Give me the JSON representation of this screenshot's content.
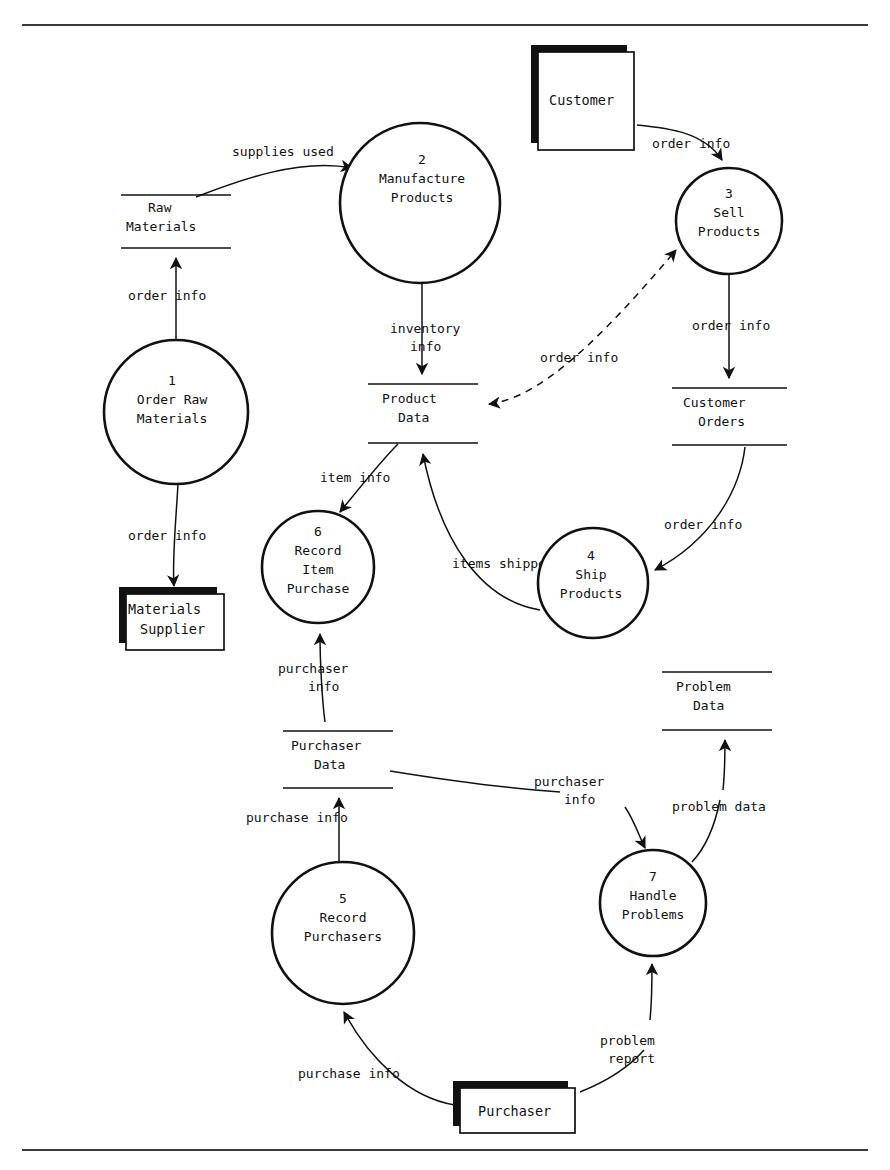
{
  "diagram": {
    "type": "data-flow-diagram",
    "title": "",
    "notation": "Yourdon/DeMarco",
    "processes": [
      {
        "id": "p1",
        "number": "1",
        "name_line1": "Order Raw",
        "name_line2": "Materials",
        "name_line3": "",
        "cx": 176,
        "cy": 412,
        "r": 72
      },
      {
        "id": "p2",
        "number": "2",
        "name_line1": "Manufacture",
        "name_line2": "Products",
        "name_line3": "",
        "cx": 420,
        "cy": 203,
        "r": 80
      },
      {
        "id": "p3",
        "number": "3",
        "name_line1": "Sell",
        "name_line2": "Products",
        "name_line3": "",
        "cx": 729,
        "cy": 221,
        "r": 53
      },
      {
        "id": "p4",
        "number": "4",
        "name_line1": "Ship",
        "name_line2": "Products",
        "name_line3": "",
        "cx": 593,
        "cy": 583,
        "r": 55
      },
      {
        "id": "p5",
        "number": "5",
        "name_line1": "Record",
        "name_line2": "Purchasers",
        "name_line3": "",
        "cx": 343,
        "cy": 933,
        "r": 71
      },
      {
        "id": "p6",
        "number": "6",
        "name_line1": "Record",
        "name_line2": "Item",
        "name_line3": "Purchase",
        "cx": 318,
        "cy": 567,
        "r": 56
      },
      {
        "id": "p7",
        "number": "7",
        "name_line1": "Handle",
        "name_line2": "Problems",
        "name_line3": "",
        "cx": 653,
        "cy": 903,
        "r": 53
      }
    ],
    "data_stores": [
      {
        "id": "ds-raw",
        "name_line1": "Raw",
        "name_line2": "Materials",
        "x1": 121,
        "x2": 231,
        "y_top": 195,
        "y_bottom": 248
      },
      {
        "id": "ds-product",
        "name_line1": "Product",
        "name_line2": "Data",
        "x1": 368,
        "x2": 478,
        "y_top": 384,
        "y_bottom": 443
      },
      {
        "id": "ds-customer-orders",
        "name_line1": "Customer",
        "name_line2": "Orders",
        "x1": 672,
        "x2": 787,
        "y_top": 388,
        "y_bottom": 445
      },
      {
        "id": "ds-purchaser",
        "name_line1": "Purchaser",
        "name_line2": "Data",
        "x1": 283,
        "x2": 393,
        "y_top": 731,
        "y_bottom": 788
      },
      {
        "id": "ds-problem",
        "name_line1": "Problem",
        "name_line2": "Data",
        "x1": 662,
        "x2": 772,
        "y_top": 672,
        "y_bottom": 730
      }
    ],
    "external_entities": [
      {
        "id": "ext-customer",
        "name": "Customer",
        "x": 538,
        "y": 52,
        "w": 96,
        "h": 98
      },
      {
        "id": "ext-materials-supplier",
        "name_line1": "Materials",
        "name_line2": "Supplier",
        "x": 126,
        "y": 594,
        "w": 98,
        "h": 56
      },
      {
        "id": "ext-purchaser",
        "name": "Purchaser",
        "x": 460,
        "y": 1088,
        "w": 115,
        "h": 45
      }
    ],
    "data_flows": [
      {
        "id": "f-supplies-used",
        "label": "supplies used",
        "from": "ds-raw",
        "to": "p2",
        "label_x": 232,
        "label_y": 156,
        "style": "solid"
      },
      {
        "id": "f-order-info-raw",
        "label": "order info",
        "from": "p1",
        "to": "ds-raw",
        "label_x": 128,
        "label_y": 300,
        "style": "solid"
      },
      {
        "id": "f-order-info-supplier",
        "label": "order info",
        "from": "p1",
        "to": "ext-materials-supplier",
        "label_x": 128,
        "label_y": 540,
        "style": "solid"
      },
      {
        "id": "f-order-info-customer",
        "label": "order info",
        "from": "ext-customer",
        "to": "p3",
        "label_x": 652,
        "label_y": 148,
        "style": "solid"
      },
      {
        "id": "f-inventory-info",
        "label": "inventory info",
        "label_line1": "inventory",
        "label_line2": "info",
        "from": "p2",
        "to": "ds-product",
        "label_x": 390,
        "label_y": 330,
        "style": "solid"
      },
      {
        "id": "f-order-info-product",
        "label": "order info",
        "from": "ds-product",
        "to": "p3",
        "label_x": 540,
        "label_y": 362,
        "style": "dashed"
      },
      {
        "id": "f-order-info-orders",
        "label": "order info",
        "from": "p3",
        "to": "ds-customer-orders",
        "label_x": 692,
        "label_y": 328,
        "style": "solid"
      },
      {
        "id": "f-order-info-ship",
        "label": "order info",
        "from": "ds-customer-orders",
        "to": "p4",
        "label_x": 664,
        "label_y": 528,
        "style": "solid"
      },
      {
        "id": "f-item-info",
        "label": "item info",
        "from": "p6",
        "to": "ds-product",
        "label_x": 320,
        "label_y": 480,
        "style": "solid"
      },
      {
        "id": "f-items-shipped",
        "label": "items shipped",
        "from": "p4",
        "to": "ds-product",
        "label_x": 452,
        "label_y": 566,
        "style": "solid"
      },
      {
        "id": "f-purchaser-info-store",
        "label": "purchaser info",
        "label_line1": "purchaser",
        "label_line2": "info",
        "from": "ds-purchaser",
        "to": "p6",
        "label_x": 280,
        "label_y": 673,
        "style": "solid"
      },
      {
        "id": "f-purchase-info-store",
        "label": "purchase info",
        "from": "p5",
        "to": "ds-purchaser",
        "label_x": 246,
        "label_y": 819,
        "style": "solid"
      },
      {
        "id": "f-purchaser-info-problem",
        "label": "purchaser info",
        "label_line1": "purchaser",
        "label_line2": "info",
        "from": "ds-purchaser",
        "to": "p7",
        "label_x": 536,
        "label_y": 786,
        "style": "solid"
      },
      {
        "id": "f-problem-data",
        "label": "problem data",
        "from": "p7",
        "to": "ds-problem",
        "label_x": 672,
        "label_y": 808,
        "style": "solid"
      },
      {
        "id": "f-purchase-info-ext",
        "label": "purchase info",
        "from": "ext-purchaser",
        "to": "p5",
        "label_x": 298,
        "label_y": 1075,
        "style": "solid"
      },
      {
        "id": "f-problem-report",
        "label": "problem report",
        "label_line1": "problem",
        "label_line2": "report",
        "from": "ext-purchaser",
        "to": "p7",
        "label_x": 600,
        "label_y": 1042,
        "style": "solid"
      }
    ],
    "rules": [
      {
        "id": "top-rule",
        "x1": 22,
        "x2": 868,
        "y": 25
      },
      {
        "id": "bottom-rule",
        "x1": 22,
        "x2": 868,
        "y": 1150
      }
    ]
  }
}
